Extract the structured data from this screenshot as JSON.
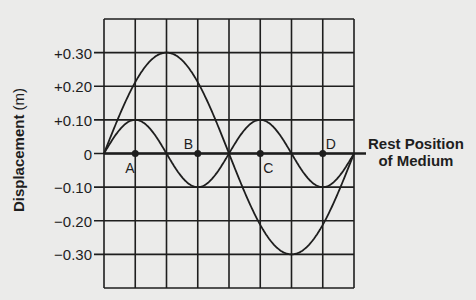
{
  "chart_data": {
    "type": "line",
    "title": "",
    "xlabel": "",
    "ylabel": "Displacement",
    "ylabel_unit": "(m)",
    "ylim": [
      -0.4,
      0.4
    ],
    "grid": true,
    "grid_columns": 8,
    "grid_rows": 8,
    "ytick_values": [
      0.3,
      0.2,
      0.1,
      0,
      -0.1,
      -0.2,
      -0.3
    ],
    "ytick_labels": [
      "+0.30",
      "+0.20",
      "+0.10",
      "0",
      "−0.10",
      "−0.20",
      "−0.30"
    ],
    "series": [
      {
        "name": "Wave 1 (large amplitude)",
        "amplitude": 0.3,
        "wavelength_columns": 8,
        "description": "One full wavelength across grid: crest +0.30 at column 2, trough -0.30 at column 6"
      },
      {
        "name": "Wave 2 (small amplitude)",
        "amplitude": 0.1,
        "wavelength_columns": 4,
        "description": "Two full wavelengths across grid: crests +0.10 at columns 1 and 5, troughs -0.10 at columns 3 and 7"
      }
    ],
    "points": [
      {
        "label": "A",
        "column": 1,
        "y": 0
      },
      {
        "label": "B",
        "column": 3,
        "y": 0
      },
      {
        "label": "C",
        "column": 5,
        "y": 0
      },
      {
        "label": "D",
        "column": 7,
        "y": 0
      }
    ],
    "annotation": [
      "Rest Position",
      "of Medium"
    ]
  },
  "colors": {
    "background": "#ebebea",
    "ink": "#1e1e1e"
  }
}
